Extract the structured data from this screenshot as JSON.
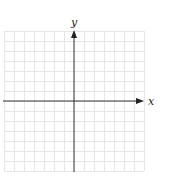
{
  "diagram": {
    "type": "coordinate-plane",
    "x_axis_label": "x",
    "y_axis_label": "y",
    "grid": {
      "columns": 14,
      "rows": 14,
      "cell_size_px": 10,
      "left": 4,
      "top": 31,
      "line_color": "#e6e6e6"
    },
    "axes": {
      "origin_px": [
        74,
        101
      ],
      "color": "#333333"
    }
  }
}
